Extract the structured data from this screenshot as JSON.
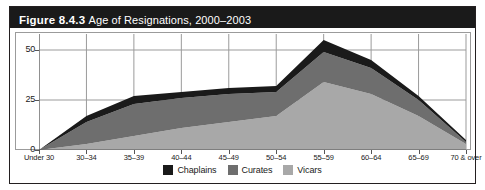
{
  "figure": {
    "number": "Figure 8.4.3",
    "caption": "Age of Resignations, 2000–2003"
  },
  "legend": {
    "items": [
      {
        "label": "Chaplains",
        "color": "#1a1a1a",
        "swatch_name": "legend-swatch-chaplains"
      },
      {
        "label": "Curates",
        "color": "#6e6e6e",
        "swatch_name": "legend-swatch-curates"
      },
      {
        "label": "Vicars",
        "color": "#a8a8a8",
        "swatch_name": "legend-swatch-vicars"
      }
    ]
  },
  "chart_data": {
    "type": "area",
    "stacked": true,
    "title": "Age of Resignations, 2000–2003",
    "xlabel": "",
    "ylabel": "",
    "ylim": [
      0,
      58
    ],
    "yticks": [
      0,
      25,
      50
    ],
    "ytick_labels": [
      "0",
      "25",
      "50"
    ],
    "grid": true,
    "legend_position": "bottom-center",
    "categories": [
      "Under 30",
      "30–34",
      "35–39",
      "40–44",
      "45–49",
      "50–54",
      "55–59",
      "60–64",
      "65–69",
      "70 & over"
    ],
    "series": [
      {
        "name": "Vicars",
        "color": "#a8a8a8",
        "values": [
          0,
          3,
          7,
          11,
          14,
          17,
          34,
          28,
          17,
          3
        ]
      },
      {
        "name": "Curates",
        "color": "#6e6e6e",
        "values": [
          0,
          11,
          16,
          15,
          14,
          12,
          15,
          13,
          8,
          1
        ]
      },
      {
        "name": "Chaplains",
        "color": "#1a1a1a",
        "values": [
          0,
          3,
          4,
          3,
          3,
          3,
          6,
          4,
          2,
          1
        ]
      }
    ],
    "series_order_bottom_to_top": [
      "Vicars",
      "Curates",
      "Chaplains"
    ],
    "totals": [
      0,
      17,
      27,
      29,
      31,
      32,
      55,
      45,
      27,
      5
    ]
  }
}
